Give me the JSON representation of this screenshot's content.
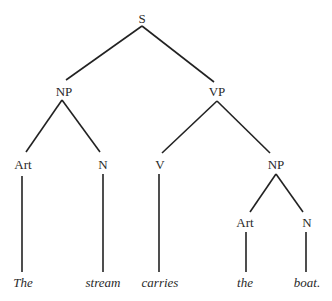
{
  "diagram": {
    "type": "syntax-tree",
    "sentence": "The stream carries the boat.",
    "nodes": [
      {
        "id": "S",
        "label": "S",
        "x": 142,
        "y": 19,
        "kind": "category"
      },
      {
        "id": "NP1",
        "label": "NP",
        "x": 64,
        "y": 92,
        "kind": "category"
      },
      {
        "id": "VP",
        "label": "VP",
        "x": 217,
        "y": 92,
        "kind": "category"
      },
      {
        "id": "Art1",
        "label": "Art",
        "x": 23,
        "y": 165,
        "kind": "category"
      },
      {
        "id": "N1",
        "label": "N",
        "x": 103,
        "y": 165,
        "kind": "category"
      },
      {
        "id": "V",
        "label": "V",
        "x": 160,
        "y": 165,
        "kind": "category"
      },
      {
        "id": "NP2",
        "label": "NP",
        "x": 276,
        "y": 165,
        "kind": "category"
      },
      {
        "id": "Art2",
        "label": "Art",
        "x": 245,
        "y": 223,
        "kind": "category"
      },
      {
        "id": "N2",
        "label": "N",
        "x": 307,
        "y": 223,
        "kind": "category"
      },
      {
        "id": "w1",
        "label": "The",
        "x": 23,
        "y": 283,
        "kind": "word"
      },
      {
        "id": "w2",
        "label": "stream",
        "x": 103,
        "y": 283,
        "kind": "word"
      },
      {
        "id": "w3",
        "label": "carries",
        "x": 160,
        "y": 283,
        "kind": "word"
      },
      {
        "id": "w4",
        "label": "the",
        "x": 245,
        "y": 283,
        "kind": "word"
      },
      {
        "id": "w5",
        "label": "boat.",
        "x": 307,
        "y": 283,
        "kind": "word"
      }
    ],
    "edges": [
      {
        "from": "S",
        "to": "NP1",
        "x1": 142,
        "y1": 26,
        "x2": 66,
        "y2": 80
      },
      {
        "from": "S",
        "to": "VP",
        "x1": 142,
        "y1": 26,
        "x2": 214,
        "y2": 82
      },
      {
        "from": "NP1",
        "to": "Art1",
        "x1": 62,
        "y1": 100,
        "x2": 26,
        "y2": 152
      },
      {
        "from": "NP1",
        "to": "N1",
        "x1": 62,
        "y1": 100,
        "x2": 100,
        "y2": 152
      },
      {
        "from": "VP",
        "to": "V",
        "x1": 217,
        "y1": 101,
        "x2": 162,
        "y2": 153
      },
      {
        "from": "VP",
        "to": "NP2",
        "x1": 217,
        "y1": 101,
        "x2": 270,
        "y2": 153
      },
      {
        "from": "Art1",
        "to": "The",
        "x1": 22,
        "y1": 176,
        "x2": 22,
        "y2": 272
      },
      {
        "from": "N1",
        "to": "stream",
        "x1": 103,
        "y1": 174,
        "x2": 103,
        "y2": 272
      },
      {
        "from": "V",
        "to": "carries",
        "x1": 159,
        "y1": 174,
        "x2": 159,
        "y2": 272
      },
      {
        "from": "NP2",
        "to": "Art2",
        "x1": 276,
        "y1": 174,
        "x2": 250,
        "y2": 212
      },
      {
        "from": "NP2",
        "to": "N2",
        "x1": 276,
        "y1": 174,
        "x2": 303,
        "y2": 212
      },
      {
        "from": "Art2",
        "to": "the",
        "x1": 246,
        "y1": 232,
        "x2": 246,
        "y2": 272
      },
      {
        "from": "N2",
        "to": "boat.",
        "x1": 306,
        "y1": 232,
        "x2": 306,
        "y2": 272
      }
    ]
  }
}
